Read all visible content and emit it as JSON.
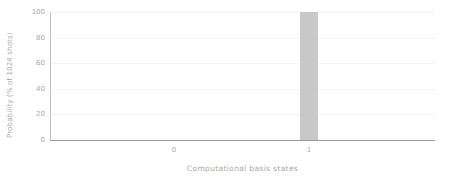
{
  "chart_data": {
    "type": "bar",
    "title": "",
    "xlabel": "Computational basis states",
    "ylabel": "Probability (% of 1024 shots)",
    "categories": [
      "0",
      "1"
    ],
    "values": [
      0,
      100
    ],
    "series": [
      {
        "name": "Probability",
        "values": [
          0,
          100
        ]
      }
    ],
    "ylim": [
      0,
      100
    ],
    "yticks": [
      "0",
      "20",
      "40",
      "60",
      "80",
      "100"
    ],
    "ytick_values": [
      0,
      20,
      40,
      60,
      80,
      100
    ],
    "xticks": [
      "0",
      "1"
    ],
    "grid": "horizontal",
    "legend": "none",
    "bar_color": "#c8c8c8",
    "text_color": "#a8a8a8",
    "axis_color": "#9a9a9a",
    "gridline_color": "#f4f4f4",
    "background": "#ffffff"
  }
}
